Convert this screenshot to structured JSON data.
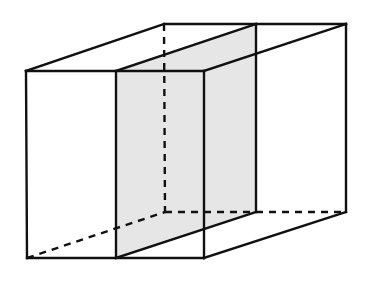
{
  "diagram": {
    "colors": {
      "edge": "#111111",
      "section_fill": "#e6e6e6",
      "background": "#ffffff"
    },
    "vertices": {
      "front_top_left": [
        26,
        71
      ],
      "front_top_right": [
        204,
        71
      ],
      "front_bottom_right": [
        204,
        258
      ],
      "front_bottom_left": [
        27,
        258
      ],
      "back_top_left": [
        164,
        24
      ],
      "back_top_right": [
        346,
        24
      ],
      "back_bottom_right": [
        346,
        212
      ],
      "back_bottom_left": [
        165,
        212
      ],
      "section_front_top": [
        116,
        71
      ],
      "section_back_top": [
        256,
        24
      ],
      "section_back_bottom": [
        256,
        212
      ],
      "section_front_bottom": [
        116,
        258
      ]
    },
    "visible_edges": [
      [
        "front_top_left",
        "front_top_right"
      ],
      [
        "front_top_right",
        "front_bottom_right"
      ],
      [
        "front_bottom_right",
        "front_bottom_left"
      ],
      [
        "front_bottom_left",
        "front_top_left"
      ],
      [
        "back_top_left",
        "back_top_right"
      ],
      [
        "back_top_right",
        "back_bottom_right"
      ],
      [
        "front_top_left",
        "back_top_left"
      ],
      [
        "front_top_right",
        "back_top_right"
      ],
      [
        "front_bottom_right",
        "back_bottom_right"
      ],
      [
        "section_front_top",
        "section_back_top"
      ],
      [
        "section_back_top",
        "section_back_bottom"
      ],
      [
        "section_front_top",
        "section_front_bottom"
      ],
      [
        "section_front_bottom",
        "section_back_bottom"
      ]
    ],
    "hidden_edges": [
      [
        "back_top_left",
        "back_bottom_left"
      ],
      [
        "back_bottom_left",
        "back_bottom_right"
      ],
      [
        "front_bottom_left",
        "back_bottom_left"
      ]
    ],
    "section_polygon": [
      "section_front_top",
      "section_back_top",
      "section_back_bottom",
      "section_front_bottom"
    ]
  }
}
